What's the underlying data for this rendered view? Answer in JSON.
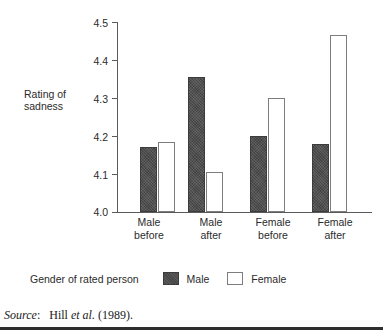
{
  "chart_data": {
    "type": "bar",
    "title": "",
    "xlabel": "",
    "ylabel": "Rating of sadness",
    "ylim": [
      4.0,
      4.5
    ],
    "yticks": [
      "4.0",
      "4.1",
      "4.2",
      "4.3",
      "4.4",
      "4.5"
    ],
    "grid": false,
    "legend_position": "bottom-left",
    "legend_title": "Gender of rated person",
    "categories": [
      "Male before",
      "Male after",
      "Female before",
      "Female after"
    ],
    "category_lines": [
      [
        "Male",
        "before"
      ],
      [
        "Male",
        "after"
      ],
      [
        "Female",
        "before"
      ],
      [
        "Female",
        "after"
      ]
    ],
    "series": [
      {
        "name": "Male",
        "color": "#4c4c4c",
        "values": [
          4.17,
          4.355,
          4.2,
          4.18
        ]
      },
      {
        "name": "Female",
        "color": "#ffffff",
        "values": [
          4.185,
          4.105,
          4.3,
          4.465
        ]
      }
    ]
  },
  "axis": {
    "y_title_line1": "Rating of",
    "y_title_line2": "sadness"
  },
  "legend": {
    "title": "Gender of rated person",
    "entries": [
      {
        "label": "Male"
      },
      {
        "label": "Female"
      }
    ]
  },
  "source": {
    "label": "Source",
    "colon": ":",
    "author": "Hill",
    "etal": "et al.",
    "year": "(1989)."
  },
  "colors": {
    "male_bar": "#4c4c4c",
    "female_bar": "#ffffff",
    "axis": "#5a5a5a",
    "text": "#2b2b2b",
    "rule": "#2e2e2e"
  }
}
